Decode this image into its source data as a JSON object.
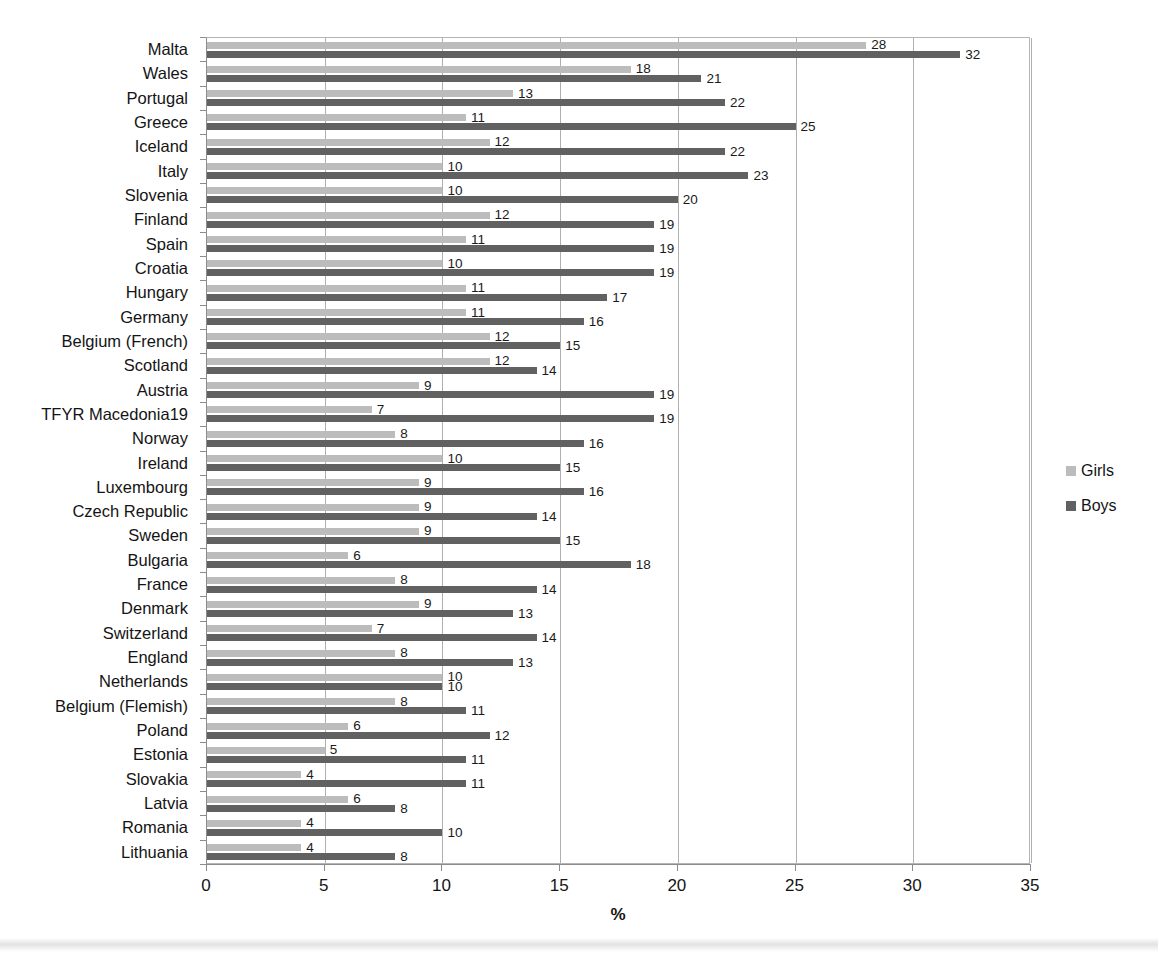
{
  "chart_data": {
    "type": "bar",
    "orientation": "horizontal",
    "title": "",
    "xlabel": "%",
    "ylabel": "",
    "xlim": [
      0,
      35
    ],
    "xticks": [
      0,
      5,
      10,
      15,
      20,
      25,
      30,
      35
    ],
    "grid": "vertical",
    "legend_position": "right",
    "categories": [
      "Malta",
      "Wales",
      "Portugal",
      "Greece",
      "Iceland",
      "Italy",
      "Slovenia",
      "Finland",
      "Spain",
      "Croatia",
      "Hungary",
      "Germany",
      "Belgium (French)",
      "Scotland",
      "Austria",
      "TFYR Macedonia19",
      "Norway",
      "Ireland",
      "Luxembourg",
      "Czech Republic",
      "Sweden",
      "Bulgaria",
      "France",
      "Denmark",
      "Switzerland",
      "England",
      "Netherlands",
      "Belgium (Flemish)",
      "Poland",
      "Estonia",
      "Slovakia",
      "Latvia",
      "Romania",
      "Lithuania"
    ],
    "series": [
      {
        "name": "Girls",
        "color": "#bcbcbc",
        "values": [
          28,
          18,
          13,
          11,
          12,
          10,
          10,
          12,
          11,
          10,
          11,
          11,
          12,
          12,
          9,
          7,
          8,
          10,
          9,
          9,
          9,
          6,
          8,
          9,
          7,
          8,
          10,
          8,
          6,
          5,
          4,
          6,
          4,
          4
        ]
      },
      {
        "name": "Boys",
        "color": "#616161",
        "values": [
          32,
          21,
          22,
          25,
          22,
          23,
          20,
          19,
          19,
          19,
          17,
          16,
          15,
          14,
          19,
          19,
          16,
          15,
          16,
          14,
          15,
          18,
          14,
          13,
          14,
          13,
          10,
          11,
          12,
          11,
          11,
          8,
          10,
          8
        ]
      }
    ]
  },
  "legend": {
    "items": [
      {
        "label": "Girls",
        "color": "#bcbcbc"
      },
      {
        "label": "Boys",
        "color": "#616161"
      }
    ]
  }
}
